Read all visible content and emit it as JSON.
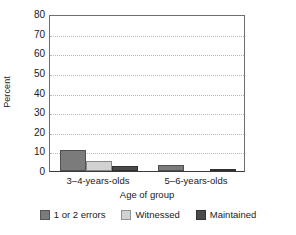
{
  "chart_data": {
    "type": "bar",
    "title": "",
    "xlabel": "Age of group",
    "ylabel": "Percent",
    "categories": [
      "3–4-years-olds",
      "5–6-years-olds"
    ],
    "series": [
      {
        "name": "1 or 2 errors",
        "values": [
          10.5,
          3.0
        ],
        "color": "#7b7b7b"
      },
      {
        "name": "Witnessed",
        "values": [
          5.0,
          0.0
        ],
        "color": "#d2d2d2"
      },
      {
        "name": "Maintained",
        "values": [
          2.5,
          1.0
        ],
        "color": "#4a4a4a"
      }
    ],
    "ylim": [
      0,
      80
    ],
    "yticks": [
      0,
      10,
      20,
      30,
      40,
      50,
      60,
      70,
      80
    ],
    "ytick_labels": [
      "0",
      "10",
      "20",
      "30",
      "40",
      "50",
      "60",
      "70",
      "80"
    ],
    "grid": true,
    "grid_style": "dotted horizontal",
    "legend_position": "bottom-center",
    "bar_orientation": "vertical",
    "background_color": "#ffffff",
    "axis_color": "#6e6e6e",
    "gridline_color": "#b9b9b9"
  }
}
